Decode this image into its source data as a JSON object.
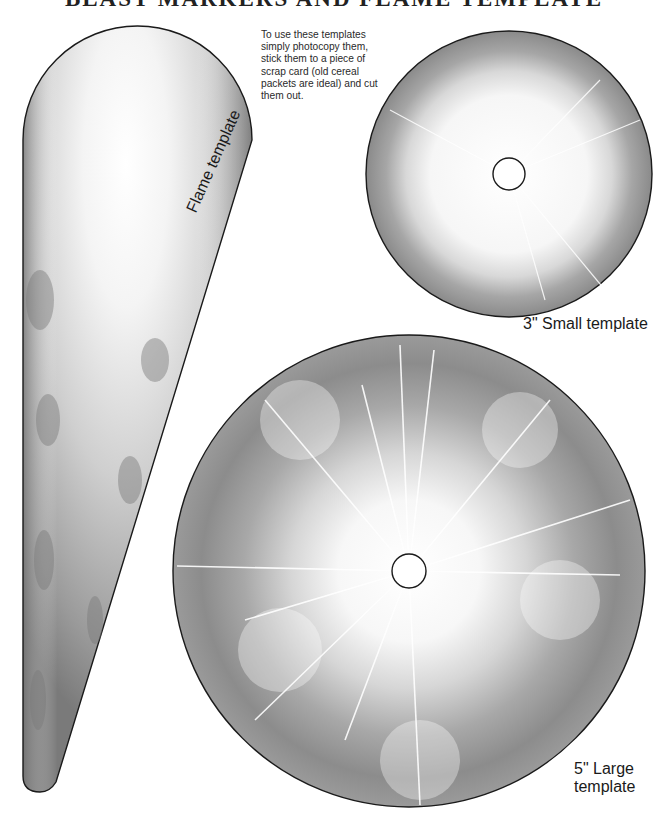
{
  "page": {
    "title": "BLAST MARKERS AND FLAME TEMPLATE",
    "instructions": "To use these templates simply photocopy them, stick them to a piece of scrap card (old cereal packets are  ideal) and cut them out."
  },
  "templates": {
    "flame": {
      "label": "Flame template"
    },
    "small": {
      "label": "3\" Small template"
    },
    "large": {
      "label_line1": "5\" Large",
      "label_line2": "template"
    }
  },
  "colors": {
    "outline": "#1a1a1a",
    "dark_smoke": "#6e6e6e",
    "mid_smoke": "#9c9c9c",
    "light_core": "#ffffff"
  }
}
